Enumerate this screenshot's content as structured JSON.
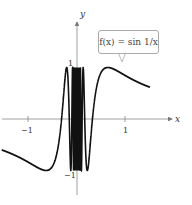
{
  "chart_data": {
    "type": "line",
    "title": "",
    "function_label": "f(x) = sin 1/x",
    "xlabel": "x",
    "ylabel": "y",
    "xticks": [
      "-1",
      "1"
    ],
    "yticks": [
      "1",
      "-1"
    ],
    "xlim": [
      -1.55,
      1.5
    ],
    "ylim": [
      -1.2,
      1.4
    ],
    "grid": false,
    "series": [
      {
        "name": "f(x) = sin(1/x)",
        "expression": "sin(1/x)"
      }
    ]
  },
  "labels": {
    "x_axis": "x",
    "y_axis": "y",
    "tick_x_neg1": "−1",
    "tick_x_pos1": "1",
    "tick_y_pos1": "1",
    "tick_y_neg1": "−1",
    "callout_text": "f(x) = sin 1/x"
  }
}
